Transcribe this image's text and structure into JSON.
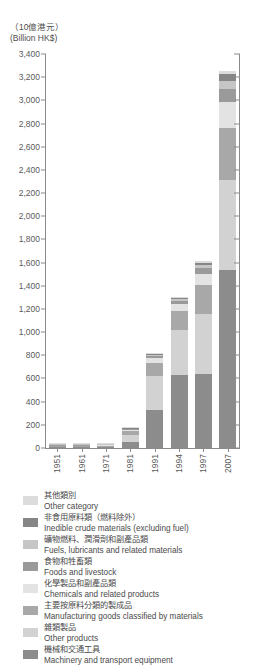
{
  "unit_label": "（10億港元）\n(Billion HK$)",
  "chart_data": {
    "type": "bar",
    "stacked": true,
    "title": "",
    "subtitle": "",
    "xlabel": "",
    "ylabel": "(Billion HK$)",
    "ylim": [
      0,
      3400
    ],
    "ytick_step": 200,
    "grid": false,
    "legend_position": "below",
    "categories": [
      "1951",
      "1961",
      "1971",
      "1981",
      "1991",
      "1994",
      "1997",
      "2007"
    ],
    "ytick_labels": [
      "3,400",
      "3,200",
      "3,000",
      "2,800",
      "2,600",
      "2,400",
      "2,200",
      "2,000",
      "1,800",
      "1,600",
      "1,400",
      "1,200",
      "1,000",
      "800",
      "600",
      "400",
      "200",
      "0"
    ],
    "series": [
      {
        "name": "Machinery and transport equipment",
        "name_zh": "機械和交通工具",
        "color": "#8c8c8c",
        "values": [
          0.3,
          1.0,
          6,
          55,
          325,
          630,
          640,
          1540
        ]
      },
      {
        "name": "Other products",
        "name_zh": "雜類製品",
        "color": "#d2d2d2",
        "values": [
          0.3,
          0.8,
          6,
          60,
          300,
          390,
          520,
          770
        ]
      },
      {
        "name": "Manufacturing goods classified by materials",
        "name_zh": "主要按原料分類的製成品",
        "color": "#a8a8a8",
        "values": [
          0.2,
          0.6,
          4,
          30,
          110,
          165,
          250,
          450
        ]
      },
      {
        "name": "Chemicals and related products",
        "name_zh": "化學製品和副產品類",
        "color": "#e3e3e3",
        "values": [
          0.1,
          0.3,
          2,
          10,
          40,
          55,
          90,
          230
        ]
      },
      {
        "name": "Foods and livestock",
        "name_zh": "食物和牲畜類",
        "color": "#9a9a9a",
        "values": [
          0.1,
          0.2,
          1,
          8,
          20,
          30,
          55,
          105
        ]
      },
      {
        "name": "Fuels, lubricants and related materials",
        "name_zh": "礦物燃料、潤滑劑和副產品類",
        "color": "#c6c6c6",
        "values": [
          0.05,
          0.1,
          0.6,
          4,
          9,
          14,
          25,
          75
        ]
      },
      {
        "name": "Inedible crude materials (excluding fuel)",
        "name_zh": "非食用原料類（燃料除外）",
        "color": "#868686",
        "values": [
          0.05,
          0.1,
          0.5,
          3,
          8,
          12,
          20,
          55
        ]
      },
      {
        "name": "Other category",
        "name_zh": "其他類別",
        "color": "#dcdcdc",
        "values": [
          0.05,
          0.1,
          0.4,
          2,
          5,
          8,
          15,
          25
        ]
      }
    ],
    "totals": [
      1,
      3,
      20,
      172,
      817,
      1304,
      1615,
      3250
    ]
  },
  "legend": {
    "items": [
      {
        "label_zh": "其他類別",
        "label_en": "Other category",
        "color": "#dcdcdc"
      },
      {
        "label_zh": "非食用原料類（燃料除外）",
        "label_en": "Inedible crude materials (excluding fuel)",
        "color": "#868686"
      },
      {
        "label_zh": "礦物燃料、潤滑劑和副產品類",
        "label_en": "Fuels, lubricants and related materials",
        "color": "#c6c6c6"
      },
      {
        "label_zh": "食物和牲畜類",
        "label_en": "Foods and livestock",
        "color": "#9a9a9a"
      },
      {
        "label_zh": "化學製品和副產品類",
        "label_en": "Chemicals and related products",
        "color": "#e3e3e3"
      },
      {
        "label_zh": "主要按原料分類的製成品",
        "label_en": "Manufacturing goods classified by materials",
        "color": "#a8a8a8"
      },
      {
        "label_zh": "雜類製品",
        "label_en": "Other products",
        "color": "#d2d2d2"
      },
      {
        "label_zh": "機械和交通工具",
        "label_en": "Machinery and transport equipment",
        "color": "#8c8c8c"
      }
    ]
  }
}
